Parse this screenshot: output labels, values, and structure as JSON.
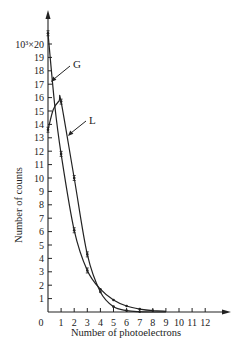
{
  "chart_data": {
    "type": "line",
    "title": "",
    "xlabel": "Number of photoelectrons",
    "ylabel": "Number of counts",
    "y_unit_prefix": "10³×",
    "x_ticks": [
      "0",
      "1",
      "2",
      "3",
      "4",
      "5",
      "6",
      "7",
      "8",
      "9",
      "10",
      "11",
      "12"
    ],
    "y_ticks": [
      "1",
      "2",
      "3",
      "4",
      "5",
      "6",
      "7",
      "8",
      "9",
      "10",
      "11",
      "12",
      "13",
      "14",
      "15",
      "16",
      "17",
      "18",
      "19",
      "20"
    ],
    "y_top_label": "10³×20",
    "xlim": [
      0,
      12
    ],
    "ylim": [
      0,
      20
    ],
    "grid": false,
    "legend": "inline labels with arrows",
    "x": [
      0,
      1,
      2,
      3,
      4,
      5,
      6,
      7,
      8,
      9
    ],
    "series": [
      {
        "name": "G",
        "values": [
          20.8,
          11.8,
          6.1,
          3.1,
          1.7,
          0.9,
          0.45,
          0.22,
          0.1,
          0.05
        ],
        "color": "#222222"
      },
      {
        "name": "L",
        "values": [
          13.6,
          15.7,
          10.0,
          4.3,
          1.5,
          0.4,
          0.1,
          0.02,
          0.0,
          0.0
        ],
        "color": "#222222"
      }
    ],
    "annotations": [
      {
        "text": "G",
        "points_to": "G curve near x=0.2"
      },
      {
        "text": "L",
        "points_to": "L curve near x=1.5"
      }
    ]
  }
}
